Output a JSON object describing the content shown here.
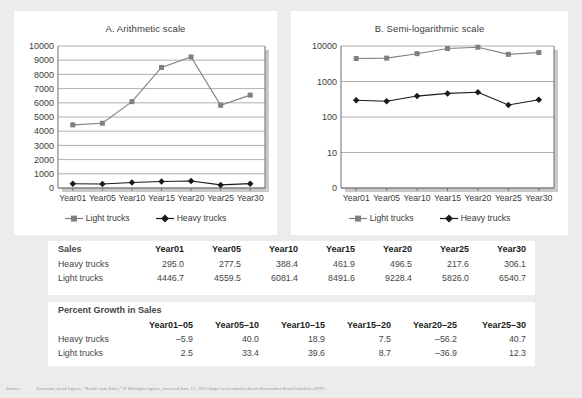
{
  "charts": [
    {
      "id": "arithmetic",
      "title": "A. Arithmetic scale",
      "legend": [
        {
          "name": "Light trucks",
          "color": "#808080",
          "marker": "square"
        },
        {
          "name": "Heavy trucks",
          "color": "#1a1a1a",
          "marker": "diamond"
        }
      ]
    },
    {
      "id": "semilog",
      "title": "B. Semi-logarithmic scale",
      "legend": [
        {
          "name": "Light trucks",
          "color": "#808080",
          "marker": "square"
        },
        {
          "name": "Heavy trucks",
          "color": "#1a1a1a",
          "marker": "diamond"
        }
      ]
    }
  ],
  "chart_data": [
    {
      "type": "line",
      "title": "A. Arithmetic scale",
      "xlabel": "",
      "ylabel": "",
      "scale": "linear",
      "grid": true,
      "legend_position": "bottom",
      "categories": [
        "Year01",
        "Year05",
        "Year10",
        "Year15",
        "Year20",
        "Year25",
        "Year30"
      ],
      "yticks": [
        0,
        1000,
        2000,
        3000,
        4000,
        5000,
        6000,
        7000,
        8000,
        9000,
        10000
      ],
      "ylim": [
        0,
        10000
      ],
      "series": [
        {
          "name": "Light trucks",
          "color": "#808080",
          "values": [
            4446.7,
            4559.5,
            6081.4,
            8491.6,
            9228.4,
            5826.0,
            6540.7
          ]
        },
        {
          "name": "Heavy trucks",
          "color": "#1a1a1a",
          "values": [
            295.0,
            277.5,
            388.4,
            461.9,
            496.5,
            217.6,
            306.1
          ]
        }
      ]
    },
    {
      "type": "line",
      "title": "B. Semi-logarithmic scale",
      "xlabel": "",
      "ylabel": "",
      "scale": "log",
      "grid": true,
      "legend_position": "bottom",
      "categories": [
        "Year01",
        "Year05",
        "Year10",
        "Year15",
        "Year20",
        "Year25",
        "Year30"
      ],
      "yticks": [
        0,
        10,
        100,
        1000,
        10000
      ],
      "ylim": [
        0,
        10000
      ],
      "series": [
        {
          "name": "Light trucks",
          "color": "#808080",
          "values": [
            4446.7,
            4559.5,
            6081.4,
            8491.6,
            9228.4,
            5826.0,
            6540.7
          ]
        },
        {
          "name": "Heavy trucks",
          "color": "#1a1a1a",
          "values": [
            295.0,
            277.5,
            388.4,
            461.9,
            496.5,
            217.6,
            306.1
          ]
        }
      ]
    }
  ],
  "tables": {
    "sales": {
      "title": "Sales",
      "columns": [
        "Year01",
        "Year05",
        "Year10",
        "Year15",
        "Year20",
        "Year25",
        "Year30"
      ],
      "rows": [
        {
          "label": "Heavy trucks",
          "values": [
            "295.0",
            "277.5",
            "388.4",
            "461.9",
            "496.5",
            "217.6",
            "306.1"
          ]
        },
        {
          "label": "Light trucks",
          "values": [
            "4446.7",
            "4559.5",
            "6081.4",
            "8491.6",
            "9228.4",
            "5826.0",
            "6540.7"
          ]
        }
      ]
    },
    "growth": {
      "title": "Percent Growth in Sales",
      "columns": [
        "Year01–05",
        "Year05–10",
        "Year10–15",
        "Year15–20",
        "Year20–25",
        "Year25–30"
      ],
      "rows": [
        {
          "label": "Heavy trucks",
          "values": [
            "–5.9",
            "40.0",
            "18.9",
            "7.5",
            "–56.2",
            "40.7"
          ]
        },
        {
          "label": "Light trucks",
          "values": [
            "2.5",
            "33.4",
            "39.6",
            "8.7",
            "–36.9",
            "12.3"
          ]
        }
      ]
    }
  },
  "footnote": {
    "lead": "Source:",
    "text": "Economic trend figures, “Retail Auto Sales,” U Michigan figures, accessed June 15, 2015 (http://www.umich.edu/sfc/Economics/RetailAutoSales.PDF)"
  }
}
